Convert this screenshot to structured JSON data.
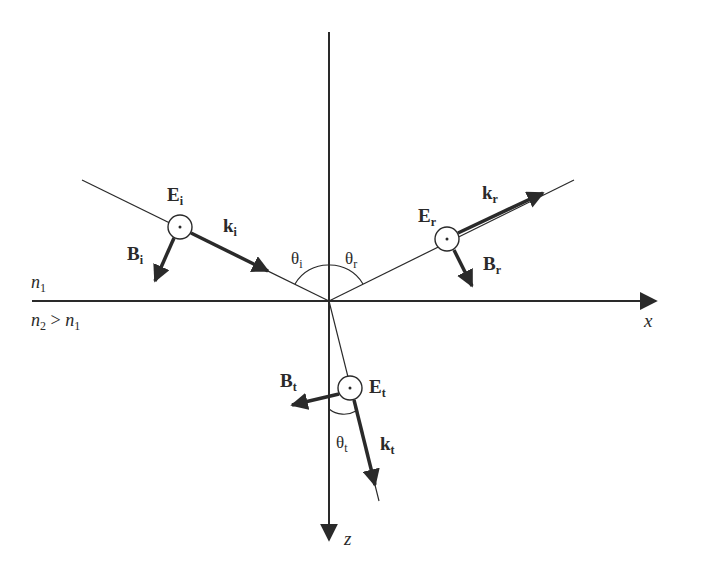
{
  "diagram": {
    "axes": {
      "x_label": "x",
      "z_label": "z"
    },
    "media": {
      "upper": {
        "label": "n",
        "sub": "1"
      },
      "lower": {
        "label_a": "n",
        "sub_a": "2",
        "relation": " > ",
        "label_b": "n",
        "sub_b": "1"
      }
    },
    "incident": {
      "E": {
        "main": "E",
        "sub": "i"
      },
      "k": {
        "main": "k",
        "sub": "i"
      },
      "B": {
        "main": "B",
        "sub": "i"
      },
      "angle": {
        "main": "θ",
        "sub": "i"
      }
    },
    "reflected": {
      "E": {
        "main": "E",
        "sub": "r"
      },
      "k": {
        "main": "k",
        "sub": "r"
      },
      "B": {
        "main": "B",
        "sub": "r"
      },
      "angle": {
        "main": "θ",
        "sub": "r"
      }
    },
    "transmitted": {
      "E": {
        "main": "E",
        "sub": "t"
      },
      "k": {
        "main": "k",
        "sub": "t"
      },
      "B": {
        "main": "B",
        "sub": "t"
      },
      "angle": {
        "main": "θ",
        "sub": "t"
      }
    },
    "colors": {
      "ink": "#2a2a2a",
      "background": "#ffffff"
    }
  }
}
